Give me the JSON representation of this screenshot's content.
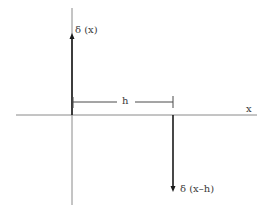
{
  "diagram": {
    "type": "delta-function-plot",
    "labels": {
      "delta_x": "δ (x)",
      "delta_x_minus_h": "δ (x–h)",
      "offset": "h",
      "x_axis": "x"
    },
    "colors": {
      "axis": "#8a8a8a",
      "arrow": "#1a1a1a",
      "dimension": "#4a4a4a",
      "text": "#3a3a3a",
      "background": "#ffffff"
    },
    "impulses": [
      {
        "name": "delta(x)",
        "position": 0,
        "direction": "up"
      },
      {
        "name": "delta(x-h)",
        "position": "h",
        "direction": "down"
      }
    ]
  }
}
